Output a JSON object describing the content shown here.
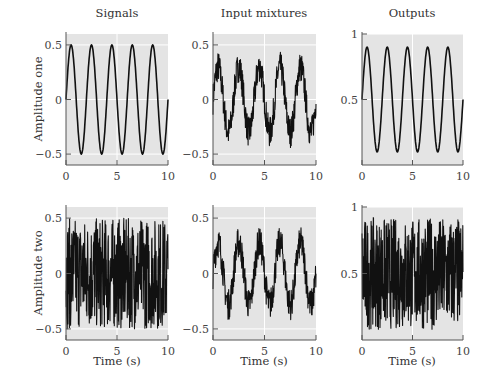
{
  "figure": {
    "col_titles": [
      "Signals",
      "Input mixtures",
      "Outputs"
    ],
    "row_labels": [
      "Amplitude one",
      "Amplitude two"
    ],
    "xlabel": "Time (s)",
    "colors": {
      "plot_bg": "#e4e4e4",
      "grid": "#ffffff",
      "line": "#111111",
      "axis": "#555555"
    }
  },
  "chart_data": [
    {
      "id": "signals-one",
      "type": "line",
      "title": "Signals",
      "xlabel": "",
      "ylabel": "Amplitude one",
      "xlim": [
        0,
        10
      ],
      "ylim": [
        -0.6,
        0.6
      ],
      "xticks": [
        "0",
        "5",
        "10"
      ],
      "yticks": [
        "0.5",
        "0",
        "-0.5"
      ],
      "ytick_values": [
        0.5,
        0,
        -0.5
      ],
      "series": [
        {
          "name": "sine",
          "kind": "sine",
          "amplitude": 0.5,
          "offset": 0,
          "cycles": 5,
          "phase": 0,
          "noise": 0
        }
      ],
      "grid": true
    },
    {
      "id": "mixtures-one",
      "type": "line",
      "title": "Input mixtures",
      "xlabel": "",
      "ylabel": "",
      "xlim": [
        0,
        10
      ],
      "ylim": [
        -0.6,
        0.6
      ],
      "xticks": [
        "0",
        "5",
        "10"
      ],
      "yticks": [
        "0.5",
        "0",
        "-0.5"
      ],
      "ytick_values": [
        0.5,
        0,
        -0.5
      ],
      "series": [
        {
          "name": "mixture 1",
          "kind": "sine+noise",
          "amplitude": 0.3,
          "offset": 0,
          "cycles": 5,
          "phase": 0,
          "noise": 0.14
        }
      ],
      "grid": true
    },
    {
      "id": "outputs-one",
      "type": "line",
      "title": "Outputs",
      "xlabel": "",
      "ylabel": "",
      "xlim": [
        0,
        10
      ],
      "ylim": [
        0,
        1
      ],
      "xticks": [
        "0",
        "5",
        "10"
      ],
      "yticks": [
        "1",
        "0.5"
      ],
      "ytick_values": [
        1,
        0.5
      ],
      "series": [
        {
          "name": "recovered sine",
          "kind": "sine",
          "amplitude": 0.4,
          "offset": 0.5,
          "cycles": 5,
          "phase": 0,
          "noise": 0
        }
      ],
      "grid": true
    },
    {
      "id": "signals-two",
      "type": "line",
      "title": "",
      "xlabel": "Time (s)",
      "ylabel": "Amplitude two",
      "xlim": [
        0,
        10
      ],
      "ylim": [
        -0.6,
        0.6
      ],
      "xticks": [
        "0",
        "5",
        "10"
      ],
      "yticks": [
        "0.5",
        "0",
        "-0.5"
      ],
      "ytick_values": [
        0.5,
        0,
        -0.5
      ],
      "series": [
        {
          "name": "uniform noise",
          "kind": "noise",
          "amplitude": 0,
          "offset": 0,
          "cycles": 0,
          "phase": 0,
          "noise": 0.5
        }
      ],
      "grid": true
    },
    {
      "id": "mixtures-two",
      "type": "line",
      "title": "",
      "xlabel": "Time (s)",
      "ylabel": "",
      "xlim": [
        0,
        10
      ],
      "ylim": [
        -0.6,
        0.6
      ],
      "xticks": [
        "0",
        "5",
        "10"
      ],
      "yticks": [
        "0.5",
        "0",
        "-0.5"
      ],
      "ytick_values": [
        0.5,
        0,
        -0.5
      ],
      "series": [
        {
          "name": "mixture 2",
          "kind": "sine+noise",
          "amplitude": 0.28,
          "offset": 0,
          "cycles": 5,
          "phase": 0,
          "noise": 0.14
        }
      ],
      "grid": true
    },
    {
      "id": "outputs-two",
      "type": "line",
      "title": "",
      "xlabel": "Time (s)",
      "ylabel": "",
      "xlim": [
        0,
        10
      ],
      "ylim": [
        0,
        1
      ],
      "xticks": [
        "0",
        "5",
        "10"
      ],
      "yticks": [
        "1",
        "0.5"
      ],
      "ytick_values": [
        1,
        0.5
      ],
      "series": [
        {
          "name": "recovered noise",
          "kind": "noise",
          "amplitude": 0,
          "offset": 0.5,
          "cycles": 0,
          "phase": 0,
          "noise": 0.42
        }
      ],
      "grid": true
    }
  ]
}
